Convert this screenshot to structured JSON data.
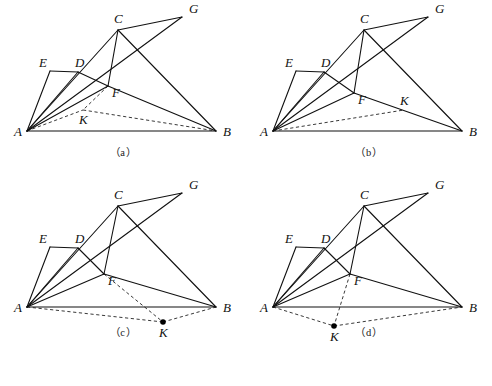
{
  "figure": {
    "type": "geometry-diagram",
    "panel_count": 4,
    "layout": "2x2-grid",
    "stroke_color": "#111111",
    "dash_color": "#222222",
    "background": "#ffffff"
  },
  "labels": {
    "A": "A",
    "B": "B",
    "C": "C",
    "D": "D",
    "E": "E",
    "F": "F",
    "G": "G",
    "K": "K"
  },
  "panels": [
    {
      "id": "a",
      "caption": "（a）",
      "k_style": "on-dashed-arc",
      "k_label": "K",
      "k_label_dx": -4,
      "k_label_dy": 14,
      "points": {
        "A": [
          27,
          131
        ],
        "B": [
          216,
          131
        ],
        "C": [
          118,
          30
        ],
        "D": [
          78,
          72
        ],
        "E": [
          50,
          71
        ],
        "F": [
          108,
          86
        ],
        "G": [
          182,
          17
        ],
        "K": [
          83,
          110
        ]
      },
      "solid_edges": [
        [
          "A",
          "B"
        ],
        [
          "A",
          "E"
        ],
        [
          "E",
          "D"
        ],
        [
          "D",
          "F"
        ],
        [
          "A",
          "D"
        ],
        [
          "A",
          "C"
        ],
        [
          "A",
          "G"
        ],
        [
          "A",
          "F"
        ],
        [
          "C",
          "F"
        ],
        [
          "C",
          "G"
        ],
        [
          "C",
          "B"
        ],
        [
          "F",
          "B"
        ]
      ],
      "dashed_edges": [
        [
          "A",
          "K"
        ],
        [
          "K",
          "B"
        ],
        [
          "F",
          "K"
        ]
      ]
    },
    {
      "id": "b",
      "caption": "（b）",
      "k_style": "on-solid-line",
      "k_label": "K",
      "k_label_dx": -4,
      "k_label_dy": -5,
      "points": {
        "A": [
          273,
          131
        ],
        "B": [
          462,
          131
        ],
        "C": [
          364,
          30
        ],
        "D": [
          324,
          72
        ],
        "E": [
          296,
          71
        ],
        "F": [
          354,
          93
        ],
        "G": [
          428,
          17
        ],
        "K": [
          404,
          110
        ]
      },
      "solid_edges": [
        [
          "A",
          "B"
        ],
        [
          "A",
          "E"
        ],
        [
          "E",
          "D"
        ],
        [
          "D",
          "F"
        ],
        [
          "A",
          "D"
        ],
        [
          "A",
          "C"
        ],
        [
          "A",
          "G"
        ],
        [
          "A",
          "F"
        ],
        [
          "C",
          "F"
        ],
        [
          "C",
          "G"
        ],
        [
          "C",
          "B"
        ],
        [
          "F",
          "B"
        ]
      ],
      "dashed_edges": [
        [
          "A",
          "K"
        ]
      ]
    },
    {
      "id": "c",
      "caption": "（c）",
      "k_style": "dot-below",
      "k_label": "K",
      "k_label_dx": -4,
      "k_label_dy": 15,
      "points": {
        "A": [
          27,
          307
        ],
        "B": [
          216,
          307
        ],
        "C": [
          118,
          206
        ],
        "D": [
          78,
          248
        ],
        "E": [
          50,
          247
        ],
        "F": [
          104,
          274
        ],
        "G": [
          182,
          193
        ],
        "K": [
          163,
          322
        ]
      },
      "solid_edges": [
        [
          "A",
          "B"
        ],
        [
          "A",
          "E"
        ],
        [
          "E",
          "D"
        ],
        [
          "D",
          "F"
        ],
        [
          "A",
          "D"
        ],
        [
          "A",
          "C"
        ],
        [
          "A",
          "G"
        ],
        [
          "A",
          "F"
        ],
        [
          "C",
          "F"
        ],
        [
          "C",
          "G"
        ],
        [
          "C",
          "B"
        ],
        [
          "F",
          "B"
        ]
      ],
      "dashed_edges": [
        [
          "A",
          "K"
        ],
        [
          "K",
          "B"
        ],
        [
          "F",
          "K"
        ]
      ]
    },
    {
      "id": "d",
      "caption": "（d）",
      "k_style": "dot-below",
      "k_label": "K",
      "k_label_dx": -4,
      "k_label_dy": 15,
      "points": {
        "A": [
          273,
          307
        ],
        "B": [
          462,
          307
        ],
        "C": [
          364,
          206
        ],
        "D": [
          324,
          248
        ],
        "E": [
          296,
          247
        ],
        "F": [
          350,
          274
        ],
        "G": [
          428,
          193
        ],
        "K": [
          334,
          326
        ]
      },
      "solid_edges": [
        [
          "A",
          "B"
        ],
        [
          "A",
          "E"
        ],
        [
          "E",
          "D"
        ],
        [
          "D",
          "F"
        ],
        [
          "A",
          "D"
        ],
        [
          "A",
          "C"
        ],
        [
          "A",
          "G"
        ],
        [
          "A",
          "F"
        ],
        [
          "C",
          "F"
        ],
        [
          "C",
          "G"
        ],
        [
          "C",
          "B"
        ],
        [
          "F",
          "B"
        ]
      ],
      "dashed_edges": [
        [
          "A",
          "K"
        ],
        [
          "K",
          "B"
        ],
        [
          "F",
          "K"
        ]
      ]
    }
  ],
  "label_offsets": {
    "A": [
      -13,
      5
    ],
    "B": [
      7,
      5
    ],
    "C": [
      -4,
      -7
    ],
    "D": [
      -3,
      -5
    ],
    "E": [
      -11,
      -4
    ],
    "F": [
      4,
      11
    ],
    "G": [
      7,
      -4
    ]
  },
  "footer": {
    "clipped_text": ""
  }
}
